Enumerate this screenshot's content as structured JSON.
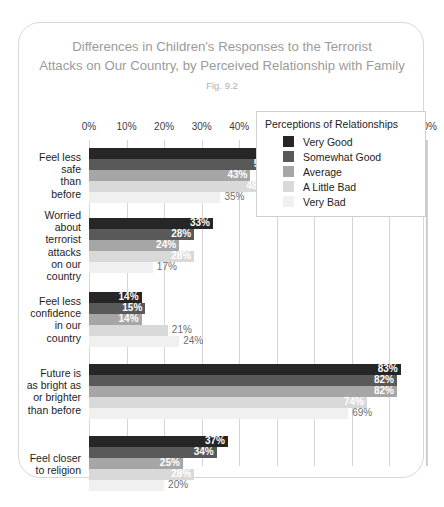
{
  "card": {
    "title_line1": "Differences in Children's Responses to the Terrorist",
    "title_line2": "Attacks on Our Country, by Perceived Relationship with Family",
    "fig_label": "Fig. 9.2"
  },
  "legend": {
    "title": "Perceptions of Relationships",
    "items": [
      {
        "label": "Very Good",
        "color": "#262626"
      },
      {
        "label": "Somewhat Good",
        "color": "#595959"
      },
      {
        "label": "Average",
        "color": "#a6a6a6"
      },
      {
        "label": "A Little Bad",
        "color": "#d9d9d9"
      },
      {
        "label": "Very Bad",
        "color": "#f0f0f0"
      }
    ]
  },
  "chart_data": {
    "type": "bar",
    "orientation": "horizontal",
    "title": "Differences in Children's Responses to the Terrorist Attacks on Our Country, by Perceived Relationship with Family",
    "subtitle": "Fig. 9.2",
    "xlabel": "",
    "ylabel": "",
    "xlim": [
      0,
      90
    ],
    "xticks": [
      0,
      10,
      20,
      30,
      40,
      50,
      60,
      70,
      80,
      90
    ],
    "xtick_labels": [
      "0%",
      "10%",
      "20%",
      "30%",
      "40%",
      "50%",
      "60%",
      "70%",
      "80%",
      "90%"
    ],
    "grid": true,
    "legend_position": "inside-right",
    "categories": [
      "Feel less safe than before",
      "Worried about terrorist attacks on our country",
      "Feel less confidence in our country",
      "Future is as bright as or brighter than before",
      "Feel closer to religion"
    ],
    "category_lines": [
      [
        "Feel less",
        "safe",
        "than",
        "before"
      ],
      [
        "Worried",
        "about",
        "terrorist",
        "attacks",
        "on our",
        "country"
      ],
      [
        "Feel less",
        "confidence",
        "in our",
        "country"
      ],
      [
        "Future is",
        "as bright as",
        "or brighter",
        "than before"
      ],
      [
        "Feel closer",
        "to religion"
      ]
    ],
    "series": [
      {
        "name": "Very Good",
        "color": "#262626",
        "values": [
          52,
          33,
          14,
          83,
          37
        ]
      },
      {
        "name": "Somewhat Good",
        "color": "#595959",
        "values": [
          50,
          28,
          15,
          82,
          34
        ]
      },
      {
        "name": "Average",
        "color": "#a6a6a6",
        "values": [
          43,
          24,
          14,
          82,
          25
        ]
      },
      {
        "name": "A Little Bad",
        "color": "#d9d9d9",
        "values": [
          48,
          28,
          21,
          74,
          28
        ]
      },
      {
        "name": "Very Bad",
        "color": "#f0f0f0",
        "values": [
          35,
          17,
          24,
          69,
          20
        ]
      }
    ],
    "value_labels": [
      [
        "52%",
        "50%",
        "43%",
        "48%",
        "35%"
      ],
      [
        "33%",
        "28%",
        "24%",
        "28%",
        "17%"
      ],
      [
        "14%",
        "15%",
        "14%",
        "21%",
        "24%"
      ],
      [
        "83%",
        "82%",
        "82%",
        "74%",
        "69%"
      ],
      [
        "37%",
        "34%",
        "25%",
        "28%",
        "20%"
      ]
    ]
  }
}
